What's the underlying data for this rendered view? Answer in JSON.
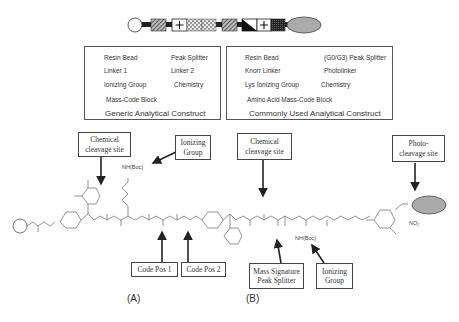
{
  "construct_bar": {
    "segments": [
      "resin-bead",
      "linker-1",
      "ionizing-group",
      "mass-code-block",
      "mass-code-block",
      "linker-1",
      "peak-splitter",
      "ionizing-group",
      "linker-2",
      "chemistry"
    ],
    "ionizing_symbol": "+"
  },
  "legend_generic": {
    "title": "Generic Analytical Construct",
    "items": [
      {
        "icon": "resin-bead",
        "label": "Resin Bead"
      },
      {
        "icon": "peak-splitter",
        "label": "Peak Splitter"
      },
      {
        "icon": "linker-1",
        "label": "Linker 1"
      },
      {
        "icon": "linker-2",
        "label": "Linker 2"
      },
      {
        "icon": "ionizing-group",
        "label": "Ionizing Group"
      },
      {
        "icon": "chemistry",
        "label": "Chemistry"
      },
      {
        "icon": "mass-code-block",
        "label": "Mass-Code Block"
      }
    ]
  },
  "legend_common": {
    "title": "Commonly Used Analytical Construct",
    "items": [
      {
        "icon": "resin-bead",
        "label": "Resin Bead"
      },
      {
        "icon": "peak-splitter",
        "label": "(G0/G3) Peak Splitter"
      },
      {
        "icon": "knorr-linker",
        "label": "Knorr Linker"
      },
      {
        "icon": "photolinker",
        "label": "Photolinker"
      },
      {
        "icon": "lys-ionizing-group",
        "label": "Lys Ionizing Group"
      },
      {
        "icon": "chemistry",
        "label": "Chemistry"
      },
      {
        "icon": "amino-acid-mass-code-block",
        "label": "Amino Acid Mass-Code Block"
      }
    ]
  },
  "callouts": {
    "chem_cleavage_a": "Chemical\ncleavage site",
    "ionizing_a": "Ionizing\nGroup",
    "code_pos_1": "Code Pos 1",
    "code_pos_2": "Code Pos 2",
    "chem_cleavage_b": "Chemical\ncleavage site",
    "photo_cleavage": "Photo-\ncleavage site",
    "mass_signature": "Mass Signature\nPeak Splitter",
    "ionizing_b": "Ionizing\nGroup"
  },
  "chem_labels": {
    "nh_boc_a": "NH(Boc)",
    "nh_boc_b": "NH(Boc)",
    "no2": "NO₂",
    "h": "H",
    "n": "N",
    "o": "O"
  },
  "panels": {
    "a": "(A)",
    "b": "(B)"
  }
}
